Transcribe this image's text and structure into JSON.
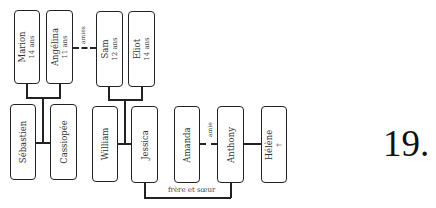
{
  "diagram": {
    "type": "family-tree",
    "people": [
      {
        "id": "marion",
        "name": "Marion",
        "detail": "14 ans"
      },
      {
        "id": "angelina",
        "name": "Angélina",
        "detail": "11 ans"
      },
      {
        "id": "sam",
        "name": "Sam",
        "detail": "12 ans"
      },
      {
        "id": "eliot",
        "name": "Eliot",
        "detail": "14 ans"
      },
      {
        "id": "sebastien",
        "name": "Sébastien",
        "detail": ""
      },
      {
        "id": "cassiopee",
        "name": "Cassiopée",
        "detail": ""
      },
      {
        "id": "william",
        "name": "William",
        "detail": ""
      },
      {
        "id": "jessica",
        "name": "Jessica",
        "detail": ""
      },
      {
        "id": "amanda",
        "name": "Amanda",
        "detail": ""
      },
      {
        "id": "anthony",
        "name": "Anthony",
        "detail": ""
      },
      {
        "id": "helene",
        "name": "Hélène",
        "detail": "†"
      }
    ],
    "relations": [
      {
        "from": "angelina",
        "to": "sam",
        "style": "dashed",
        "label": "amies"
      },
      {
        "from": "amanda",
        "to": "anthony",
        "style": "dashed",
        "label": "amie"
      },
      {
        "from": "jessica",
        "to": "anthony",
        "style": "solid",
        "label": "frère et sœur"
      },
      {
        "from": "anthony",
        "to": "helene",
        "style": "solid",
        "label": ""
      },
      {
        "parents": [
          "sebastien",
          "cassiopee"
        ],
        "children": [
          "marion",
          "angelina"
        ],
        "style": "solid"
      },
      {
        "parents": [
          "william",
          "jessica"
        ],
        "children": [
          "sam",
          "eliot"
        ],
        "style": "solid"
      }
    ]
  },
  "labels": {
    "amies": "amies",
    "amie": "amie",
    "siblings": "frère et sœur"
  },
  "exercise_number": "19."
}
